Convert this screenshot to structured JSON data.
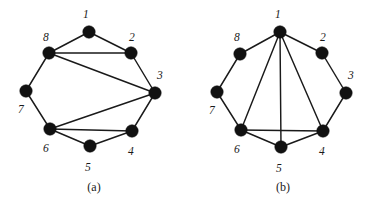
{
  "figure": {
    "background_color": "#ffffff",
    "ink_color": "#111111",
    "panels": [
      {
        "id": "a",
        "caption": "(a)",
        "graph": {
          "vertices": [
            {
              "id": "1",
              "label": "1",
              "x": 89,
              "y": 32,
              "label_x": 83,
              "label_y": 9
            },
            {
              "id": "2",
              "label": "2",
              "x": 131,
              "y": 53,
              "label_x": 129,
              "label_y": 32
            },
            {
              "id": "3",
              "label": "3",
              "x": 155,
              "y": 93,
              "label_x": 157,
              "label_y": 70
            },
            {
              "id": "4",
              "label": "4",
              "x": 132,
              "y": 131,
              "label_x": 128,
              "label_y": 146
            },
            {
              "id": "5",
              "label": "5",
              "x": 90,
              "y": 146,
              "label_x": 85,
              "label_y": 162
            },
            {
              "id": "6",
              "label": "6",
              "x": 50,
              "y": 129,
              "label_x": 43,
              "label_y": 143
            },
            {
              "id": "7",
              "label": "7",
              "x": 26,
              "y": 91,
              "label_x": 18,
              "label_y": 104
            },
            {
              "id": "8",
              "label": "8",
              "x": 49,
              "y": 53,
              "label_x": 43,
              "label_y": 32
            }
          ],
          "edges": [
            {
              "from": "1",
              "to": "2",
              "kind": "cycle"
            },
            {
              "from": "2",
              "to": "3",
              "kind": "cycle"
            },
            {
              "from": "3",
              "to": "4",
              "kind": "cycle"
            },
            {
              "from": "4",
              "to": "5",
              "kind": "cycle"
            },
            {
              "from": "5",
              "to": "6",
              "kind": "cycle"
            },
            {
              "from": "6",
              "to": "7",
              "kind": "cycle"
            },
            {
              "from": "7",
              "to": "8",
              "kind": "cycle"
            },
            {
              "from": "8",
              "to": "1",
              "kind": "cycle"
            },
            {
              "from": "8",
              "to": "2",
              "kind": "chord"
            },
            {
              "from": "8",
              "to": "3",
              "kind": "chord"
            },
            {
              "from": "6",
              "to": "3",
              "kind": "chord"
            },
            {
              "from": "6",
              "to": "4",
              "kind": "chord"
            }
          ]
        }
      },
      {
        "id": "b",
        "caption": "(b)",
        "graph": {
          "vertices": [
            {
              "id": "1",
              "label": "1",
              "x": 91,
              "y": 32,
              "label_x": 86,
              "label_y": 9
            },
            {
              "id": "2",
              "label": "2",
              "x": 133,
              "y": 53,
              "label_x": 131,
              "label_y": 32
            },
            {
              "id": "3",
              "label": "3",
              "x": 157,
              "y": 93,
              "label_x": 159,
              "label_y": 70
            },
            {
              "id": "4",
              "label": "4",
              "x": 134,
              "y": 131,
              "label_x": 130,
              "label_y": 146
            },
            {
              "id": "5",
              "label": "5",
              "x": 92,
              "y": 147,
              "label_x": 87,
              "label_y": 163
            },
            {
              "id": "6",
              "label": "6",
              "x": 52,
              "y": 130,
              "label_x": 45,
              "label_y": 144
            },
            {
              "id": "7",
              "label": "7",
              "x": 28,
              "y": 92,
              "label_x": 20,
              "label_y": 105
            },
            {
              "id": "8",
              "label": "8",
              "x": 51,
              "y": 54,
              "label_x": 45,
              "label_y": 32
            }
          ],
          "edges": [
            {
              "from": "1",
              "to": "2",
              "kind": "cycle"
            },
            {
              "from": "2",
              "to": "3",
              "kind": "cycle"
            },
            {
              "from": "3",
              "to": "4",
              "kind": "cycle"
            },
            {
              "from": "4",
              "to": "5",
              "kind": "cycle"
            },
            {
              "from": "5",
              "to": "6",
              "kind": "cycle"
            },
            {
              "from": "6",
              "to": "7",
              "kind": "cycle"
            },
            {
              "from": "7",
              "to": "8",
              "kind": "cycle"
            },
            {
              "from": "8",
              "to": "1",
              "kind": "cycle"
            },
            {
              "from": "1",
              "to": "4",
              "kind": "chord"
            },
            {
              "from": "1",
              "to": "5",
              "kind": "chord"
            },
            {
              "from": "1",
              "to": "6",
              "kind": "chord"
            },
            {
              "from": "6",
              "to": "4",
              "kind": "chord"
            }
          ]
        }
      }
    ]
  }
}
